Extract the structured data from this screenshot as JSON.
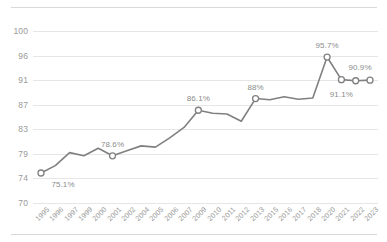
{
  "chart_data": {
    "type": "line",
    "title": "",
    "subtitle": "",
    "xlabel": "",
    "ylabel": "",
    "ylim": [
      70,
      102.2
    ],
    "yticks": [
      70,
      74,
      79,
      83,
      87,
      91,
      96,
      100
    ],
    "ytick_labels": [
      "70",
      "74",
      "79",
      "83",
      "87",
      "91",
      "96",
      "100"
    ],
    "grid": "horizontal",
    "legend": "none",
    "line_color": "#808080",
    "marker_color": "#ffffff",
    "marker_edge_color": "#808080",
    "categories": [
      "1995",
      "1996",
      "1997",
      "1999",
      "2000",
      "2001",
      "2002",
      "2004",
      "2005",
      "2006",
      "2007",
      "2009",
      "2010",
      "2011",
      "2012",
      "2013",
      "2015",
      "2016",
      "2017",
      "2018",
      "2020",
      "2021",
      "2022",
      "2023"
    ],
    "values": [
      75.1,
      76.6,
      79.2,
      78.6,
      79.9,
      78.6,
      79.5,
      80.3,
      80.1,
      81.6,
      83.3,
      86.1,
      85.6,
      85.5,
      84.3,
      88.0,
      87.8,
      88.3,
      87.9,
      88.1,
      95.7,
      91.1,
      90.9,
      91.0
    ],
    "annotations": [
      {
        "label": "75.1%",
        "category": "1995",
        "value": 75.1,
        "position": "below-right"
      },
      {
        "label": "78.6%",
        "category": "2001",
        "value": 78.6,
        "position": "above"
      },
      {
        "label": "86.1%",
        "category": "2009",
        "value": 86.1,
        "position": "above"
      },
      {
        "label": "88%",
        "category": "2013",
        "value": 88.0,
        "position": "above"
      },
      {
        "label": "95.7%",
        "category": "2020",
        "value": 95.7,
        "position": "above"
      },
      {
        "label": "91.1%",
        "category": "2021",
        "value": 91.1,
        "position": "below"
      },
      {
        "label": "90.9%",
        "category": "2023",
        "value": 91.0,
        "position": "above-left"
      }
    ],
    "markers_shown_at": [
      "1995",
      "2001",
      "2009",
      "2013",
      "2020",
      "2021",
      "2022",
      "2023"
    ]
  }
}
